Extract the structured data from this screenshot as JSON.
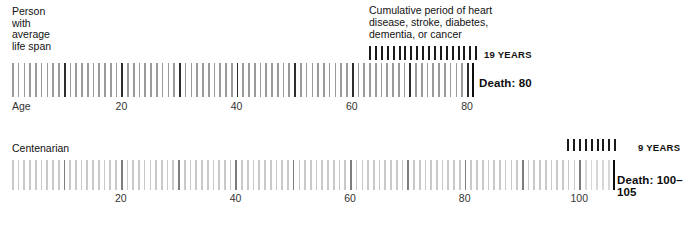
{
  "chart_data": {
    "type": "bar",
    "title": "Cumulative period of heart disease, stroke, diabetes, dementia, or cancer",
    "xlabel": "Age",
    "ylabel": "",
    "series": [
      {
        "name": "Person with average life span",
        "axis_label": "Age",
        "xlim": [
          0,
          80
        ],
        "axis_ticks": [
          {
            "value": 0,
            "label": "Age"
          },
          {
            "value": 20,
            "label": "20"
          },
          {
            "value": 40,
            "label": "40"
          },
          {
            "value": 60,
            "label": "60"
          },
          {
            "value": 80,
            "label": "80"
          }
        ],
        "death_age": 80,
        "death_label": "Death: 80",
        "disease_years": 19,
        "disease_years_label": "19 YEARS",
        "tick_count": 80,
        "tick_color": "#9a9a9a",
        "decade_tick_color": "#2e2e2e"
      },
      {
        "name": "Centenarian",
        "axis_label": "",
        "xlim": [
          0,
          105
        ],
        "axis_ticks": [
          {
            "value": 20,
            "label": "20"
          },
          {
            "value": 40,
            "label": "40"
          },
          {
            "value": 60,
            "label": "60"
          },
          {
            "value": 80,
            "label": "80"
          },
          {
            "value": 100,
            "label": "100"
          }
        ],
        "death_age_range": [
          100,
          105
        ],
        "death_label": "Death: 100–105",
        "disease_years": 9,
        "disease_years_label": "9 YEARS",
        "tick_count": 105,
        "tick_color": "#c9c9c9",
        "decade_tick_color": "#7d7d7d"
      }
    ],
    "grid": false,
    "legend": "inline"
  },
  "panels": {
    "average": {
      "heading": "Person\nwith\naverage\nlife span",
      "axis_origin_label": "Age",
      "death_label": "Death: 80",
      "years_label": "19 YEARS",
      "note": "Cumulative period of heart\ndisease, stroke, diabetes,\ndementia, or cancer"
    },
    "centenarian": {
      "heading": "Centenarian",
      "death_label": "Death: 100–105",
      "years_label": "9 YEARS"
    }
  },
  "colors": {
    "tick_light": "#c9c9c9",
    "tick_mid": "#9a9a9a",
    "tick_dark": "#2e2e2e",
    "tick_decade_light": "#7d7d7d",
    "legend_tick": "#1a1a1a",
    "text": "#111111",
    "background": "#ffffff"
  }
}
